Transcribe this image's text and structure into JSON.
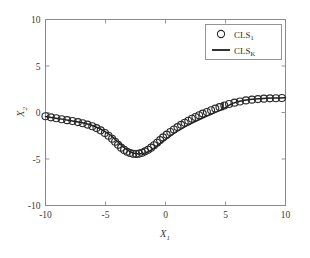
{
  "chart_data": {
    "type": "line",
    "title": "",
    "xlabel": "X",
    "xlabel_sub": "1",
    "ylabel": "X",
    "ylabel_sub": "2",
    "xlim": [
      -10,
      10
    ],
    "ylim": [
      -10,
      10
    ],
    "xticks": [
      -10,
      -5,
      0,
      5,
      10
    ],
    "xtick_labels": [
      "-10",
      "-5",
      "0",
      "5",
      "10"
    ],
    "yticks": [
      -10,
      -5,
      0,
      5,
      10
    ],
    "ytick_labels": [
      "-10",
      "-5",
      "0",
      "5",
      "10"
    ],
    "grid": false,
    "legend_position": "upper right",
    "series": [
      {
        "name": "CLS",
        "name_sub": "1",
        "style": "markers",
        "marker": "circle",
        "x": [
          -10.0,
          -9.55,
          -9.1,
          -8.65,
          -8.2,
          -7.75,
          -7.3,
          -6.9,
          -6.5,
          -6.1,
          -5.75,
          -5.4,
          -5.05,
          -4.75,
          -4.45,
          -4.2,
          -3.95,
          -3.7,
          -3.45,
          -3.2,
          -2.95,
          -2.7,
          -2.45,
          -2.2,
          -1.95,
          -1.7,
          -1.45,
          -1.2,
          -0.95,
          -0.7,
          -0.45,
          -0.2,
          0.1,
          0.4,
          0.7,
          1.0,
          1.3,
          1.6,
          1.9,
          2.2,
          2.5,
          2.8,
          3.1,
          3.45,
          3.8,
          4.15,
          4.5,
          4.9,
          5.3,
          5.75,
          6.2,
          6.7,
          7.2,
          7.7,
          8.2,
          8.7,
          9.2,
          9.7
        ],
        "y": [
          -0.4,
          -0.52,
          -0.62,
          -0.72,
          -0.82,
          -0.92,
          -1.03,
          -1.15,
          -1.3,
          -1.48,
          -1.68,
          -1.92,
          -2.2,
          -2.5,
          -2.82,
          -3.15,
          -3.48,
          -3.78,
          -4.02,
          -4.22,
          -4.36,
          -4.44,
          -4.46,
          -4.42,
          -4.32,
          -4.18,
          -4.0,
          -3.78,
          -3.52,
          -3.25,
          -2.97,
          -2.68,
          -2.38,
          -2.1,
          -1.83,
          -1.57,
          -1.33,
          -1.1,
          -0.88,
          -0.68,
          -0.48,
          -0.3,
          -0.12,
          0.06,
          0.24,
          0.42,
          0.58,
          0.76,
          0.92,
          1.06,
          1.18,
          1.3,
          1.38,
          1.44,
          1.49,
          1.52,
          1.54,
          1.56
        ]
      },
      {
        "name": "CLS",
        "name_sub": "K",
        "style": "line",
        "x": [
          -10.0,
          -9.5,
          -9.0,
          -8.5,
          -8.0,
          -7.5,
          -7.0,
          -6.5,
          -6.0,
          -5.5,
          -5.0,
          -4.6,
          -4.3,
          -4.0,
          -3.7,
          -3.4,
          -3.1,
          -2.8,
          -2.5,
          -2.2,
          -1.9,
          -1.6,
          -1.3,
          -1.0,
          -0.7,
          -0.4,
          -0.1,
          0.3,
          0.7,
          1.1,
          1.5,
          1.9,
          2.3,
          2.7,
          3.1,
          3.5,
          3.9,
          4.2,
          4.5,
          4.7,
          4.8,
          4.78,
          4.9,
          5.2,
          5.6,
          6.1,
          6.6,
          7.2,
          7.8,
          8.4,
          9.0,
          9.5,
          10.0
        ],
        "y": [
          -0.42,
          -0.54,
          -0.64,
          -0.74,
          -0.85,
          -0.96,
          -1.08,
          -1.24,
          -1.45,
          -1.72,
          -2.08,
          -2.42,
          -2.76,
          -3.12,
          -3.48,
          -3.82,
          -4.1,
          -4.3,
          -4.42,
          -4.46,
          -4.42,
          -4.3,
          -4.12,
          -3.88,
          -3.6,
          -3.3,
          -3.0,
          -2.62,
          -2.25,
          -1.92,
          -1.62,
          -1.34,
          -1.08,
          -0.84,
          -0.6,
          -0.36,
          -0.14,
          0.04,
          0.2,
          0.34,
          1.05,
          0.3,
          0.45,
          0.72,
          0.98,
          1.18,
          1.32,
          1.42,
          1.49,
          1.53,
          1.56,
          1.57,
          1.58
        ]
      }
    ],
    "legend_entries": [
      {
        "label": "CLS",
        "sub": "1",
        "type": "marker"
      },
      {
        "label": "CLS",
        "sub": "K",
        "type": "line"
      }
    ]
  }
}
